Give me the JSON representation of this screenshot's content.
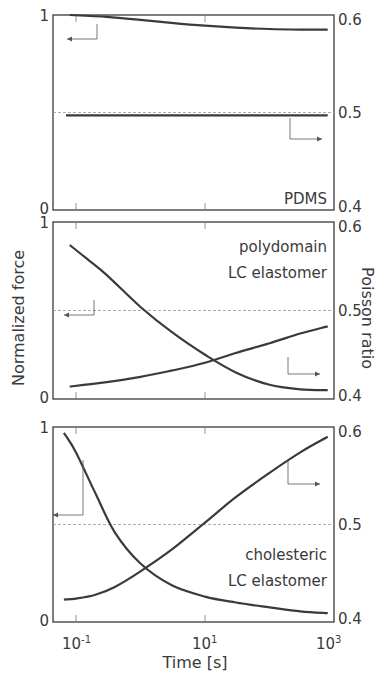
{
  "chart_data": {
    "type": "line",
    "title": "",
    "xlabel": "Time [s]",
    "ylabel_left": "Normalized force",
    "ylabel_right": "Poisson ratio",
    "x_scale": "log",
    "x_ticks": [
      "10^-1",
      "10^1",
      "10^3"
    ],
    "x_tick_labels": {
      "t0": "10",
      "e0": "-1",
      "t1": "10",
      "e1": "1",
      "t2": "10",
      "e2": "3"
    },
    "xlim": [
      0.044,
      1000
    ],
    "ylim_left": [
      0,
      1
    ],
    "ylim_right": [
      0.4,
      0.6
    ],
    "left_ticks": {
      "top": "1",
      "bottom": "0"
    },
    "right_ticks": {
      "top": "0.6",
      "mid": "0.5",
      "bottom": "0.4"
    },
    "reference_line": {
      "poisson": 0.5,
      "style": "dashed"
    },
    "panels": [
      {
        "label_lines": [
          "PDMS"
        ],
        "series": [
          {
            "name": "Normalized force",
            "axis": "left",
            "x": [
              0.08,
              0.3,
              1,
              3,
              10,
              30,
              100,
              300,
              800
            ],
            "values": [
              1.0,
              0.99,
              0.975,
              0.96,
              0.945,
              0.935,
              0.928,
              0.925,
              0.925
            ]
          },
          {
            "name": "Poisson ratio",
            "axis": "right",
            "x": [
              0.07,
              1,
              10,
              100,
              800
            ],
            "values": [
              0.497,
              0.497,
              0.497,
              0.497,
              0.497
            ]
          }
        ]
      },
      {
        "label_lines": [
          "polydomain",
          "LC elastomer"
        ],
        "series": [
          {
            "name": "Normalized force",
            "axis": "left",
            "x": [
              0.08,
              0.15,
              0.3,
              1,
              3,
              10,
              30,
              100,
              300,
              800
            ],
            "values": [
              0.87,
              0.79,
              0.7,
              0.52,
              0.38,
              0.25,
              0.15,
              0.08,
              0.055,
              0.05
            ]
          },
          {
            "name": "Poisson ratio",
            "axis": "right",
            "x": [
              0.08,
              0.3,
              1,
              3,
              10,
              30,
              100,
              300,
              800
            ],
            "values": [
              0.414,
              0.419,
              0.425,
              0.432,
              0.441,
              0.452,
              0.463,
              0.474,
              0.482
            ]
          }
        ]
      },
      {
        "label_lines": [
          "cholesteric",
          "LC elastomer"
        ],
        "series": [
          {
            "name": "Normalized force",
            "axis": "left",
            "x": [
              0.065,
              0.1,
              0.2,
              0.4,
              1,
              3,
              10,
              30,
              100,
              300,
              800
            ],
            "values": [
              0.97,
              0.87,
              0.66,
              0.46,
              0.3,
              0.19,
              0.13,
              0.1,
              0.075,
              0.055,
              0.045
            ]
          },
          {
            "name": "Poisson ratio",
            "axis": "right",
            "x": [
              0.065,
              0.1,
              0.2,
              0.4,
              1,
              3,
              10,
              30,
              100,
              300,
              800
            ],
            "values": [
              0.423,
              0.424,
              0.428,
              0.436,
              0.452,
              0.474,
              0.502,
              0.528,
              0.553,
              0.574,
              0.59
            ]
          }
        ]
      }
    ],
    "legend_arrows": "Each panel shows a left-pointing arrow for force (left axis) and right-pointing arrow for Poisson ratio (right axis)",
    "grid": false
  }
}
